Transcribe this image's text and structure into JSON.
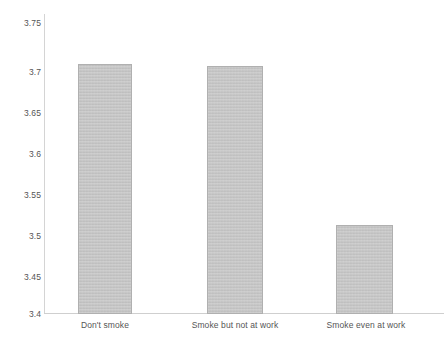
{
  "chart_data": {
    "type": "bar",
    "title": "",
    "subtitle": "",
    "xlabel": "",
    "ylabel": "",
    "categories": [
      "Don't smoke",
      "Smoke but not at work",
      "Smoke even at work"
    ],
    "values": [
      3.692,
      3.689,
      3.504
    ],
    "ylim": [
      3.4,
      3.75
    ],
    "yticks": [
      "3.4",
      "3.45",
      "3.5",
      "3.55",
      "3.6",
      "3.65",
      "3.7",
      "3.75"
    ],
    "ytick_values": [
      3.4,
      3.45,
      3.5,
      3.55,
      3.6,
      3.65,
      3.7,
      3.75
    ],
    "grid": false,
    "legend": null,
    "bar_color": "#c2c2c2",
    "bar_border_color": "#b0b0b0",
    "axis_color": "#d0d0d0",
    "text_color": "#555555"
  },
  "axis": {
    "y_tick_0": "3.4",
    "y_tick_1": "3.45",
    "y_tick_2": "3.5",
    "y_tick_3": "3.55",
    "y_tick_4": "3.6",
    "y_tick_5": "3.65",
    "y_tick_6": "3.7",
    "y_tick_7": "3.75"
  },
  "bars": [
    {
      "label": "Don't smoke",
      "value": 3.692
    },
    {
      "label": "Smoke but not at work",
      "value": 3.689
    },
    {
      "label": "Smoke even at work",
      "value": 3.504
    }
  ],
  "caption": {
    "text": ""
  }
}
